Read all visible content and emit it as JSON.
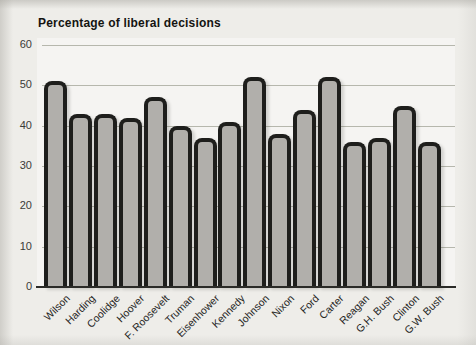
{
  "figure": {
    "title": "Percentage of liberal decisions"
  },
  "chart_data": {
    "type": "bar",
    "title": "Percentage of liberal decisions",
    "categories": [
      "Wilson",
      "Harding",
      "Coolidge",
      "Hoover",
      "F. Roosevelt",
      "Truman",
      "Eisenhower",
      "Kennedy",
      "Johnson",
      "Nixon",
      "Ford",
      "Carter",
      "Reagan",
      "G.H. Bush",
      "Clinton",
      "G.W. Bush"
    ],
    "values": [
      51,
      43,
      43,
      42,
      47,
      40,
      37,
      41,
      52,
      38,
      44,
      52,
      36,
      37,
      45,
      36
    ],
    "xlabel": "",
    "ylabel": "",
    "ylim": [
      0,
      60
    ],
    "yticks": [
      0,
      10,
      20,
      30,
      40,
      50,
      60
    ],
    "grid": true,
    "legend": false,
    "colors": {
      "bar_fill": "#b1afab",
      "bar_border": "#1e1e1c",
      "gridline": "#b6b7ad",
      "axis_line": "#2b2b28",
      "page_background": "#eeede9",
      "plot_background": "#f5f4f2",
      "title_text": "#141411",
      "tick_text": "#3b3b38"
    }
  }
}
